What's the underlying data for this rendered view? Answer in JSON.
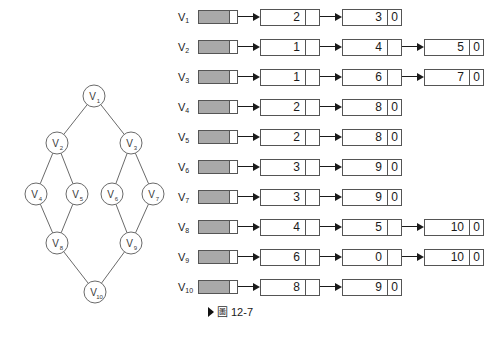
{
  "figure": {
    "caption_marker": "▶",
    "caption_symbol": "圖",
    "caption_number": "12-7"
  },
  "graph": {
    "name": "undirected-graph",
    "node_radius": 11,
    "nodes": [
      {
        "id": "V1",
        "label": "V",
        "sub": "1",
        "cx": 94,
        "cy": 96
      },
      {
        "id": "V2",
        "label": "V",
        "sub": "2",
        "cx": 57,
        "cy": 143
      },
      {
        "id": "V3",
        "label": "V",
        "sub": "3",
        "cx": 131,
        "cy": 143
      },
      {
        "id": "V4",
        "label": "V",
        "sub": "4",
        "cx": 36,
        "cy": 194
      },
      {
        "id": "V5",
        "label": "V",
        "sub": "5",
        "cx": 77,
        "cy": 194
      },
      {
        "id": "V6",
        "label": "V",
        "sub": "6",
        "cx": 112,
        "cy": 194
      },
      {
        "id": "V7",
        "label": "V",
        "sub": "7",
        "cx": 153,
        "cy": 194
      },
      {
        "id": "V8",
        "label": "V",
        "sub": "8",
        "cx": 57,
        "cy": 243
      },
      {
        "id": "V9",
        "label": "V",
        "sub": "9",
        "cx": 131,
        "cy": 243
      },
      {
        "id": "V10",
        "label": "V",
        "sub": "10",
        "cx": 95,
        "cy": 292
      }
    ],
    "edges": [
      [
        "V1",
        "V2"
      ],
      [
        "V1",
        "V3"
      ],
      [
        "V2",
        "V4"
      ],
      [
        "V2",
        "V5"
      ],
      [
        "V3",
        "V6"
      ],
      [
        "V3",
        "V7"
      ],
      [
        "V4",
        "V8"
      ],
      [
        "V5",
        "V8"
      ],
      [
        "V6",
        "V9"
      ],
      [
        "V7",
        "V9"
      ],
      [
        "V8",
        "V10"
      ],
      [
        "V9",
        "V10"
      ]
    ]
  },
  "adjacency_list": {
    "null_pointer_symbol": "0",
    "rows": [
      {
        "vertex": "V",
        "sub": "1",
        "nodes": [
          "2",
          "3"
        ]
      },
      {
        "vertex": "V",
        "sub": "2",
        "nodes": [
          "1",
          "4",
          "5"
        ]
      },
      {
        "vertex": "V",
        "sub": "3",
        "nodes": [
          "1",
          "6",
          "7"
        ]
      },
      {
        "vertex": "V",
        "sub": "4",
        "nodes": [
          "2",
          "8"
        ]
      },
      {
        "vertex": "V",
        "sub": "5",
        "nodes": [
          "2",
          "8"
        ]
      },
      {
        "vertex": "V",
        "sub": "6",
        "nodes": [
          "3",
          "9"
        ]
      },
      {
        "vertex": "V",
        "sub": "7",
        "nodes": [
          "3",
          "9"
        ]
      },
      {
        "vertex": "V",
        "sub": "8",
        "nodes": [
          "4",
          "5",
          "10"
        ]
      },
      {
        "vertex": "V",
        "sub": "9",
        "nodes": [
          "6",
          "0",
          "10"
        ]
      },
      {
        "vertex": "V",
        "sub": "10",
        "nodes": [
          "8",
          "9"
        ]
      }
    ]
  },
  "colors": {
    "header_cell_fill": "#a9a9a9",
    "stroke": "#555555",
    "ink": "#1a1a1a",
    "background": "#ffffff"
  }
}
